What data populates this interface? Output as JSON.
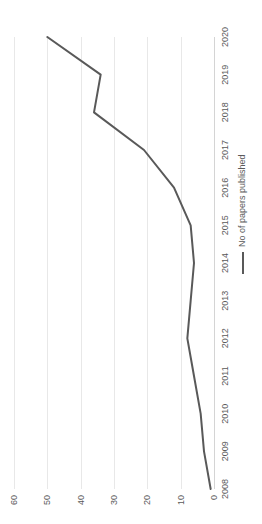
{
  "chart_data": {
    "type": "line",
    "title": "",
    "xlabel": "",
    "ylabel": "",
    "categories": [
      "2008",
      "2009",
      "2010",
      "2011",
      "2012",
      "2013",
      "2014",
      "2015",
      "2016",
      "2017",
      "2018",
      "2019",
      "2020"
    ],
    "series": [
      {
        "name": "No of papers published",
        "values": [
          1,
          3,
          4,
          6,
          8,
          7,
          6,
          7,
          12,
          21,
          36,
          34,
          50
        ],
        "color": "#595959"
      }
    ],
    "ylim": [
      0,
      60
    ],
    "ytick_labels": [
      "0",
      "10",
      "20",
      "30",
      "40",
      "50",
      "60"
    ],
    "ytick_values": [
      0,
      10,
      20,
      30,
      40,
      50,
      60
    ],
    "grid": true,
    "grid_color": "#e8e8e8",
    "axis_color": "#d4d4d4",
    "legend_position": "bottom-right",
    "orientation": "rotated-90-ccw"
  },
  "legend": {
    "entries": [
      {
        "label": "No of papers published",
        "icon": "line-swatch"
      }
    ]
  }
}
